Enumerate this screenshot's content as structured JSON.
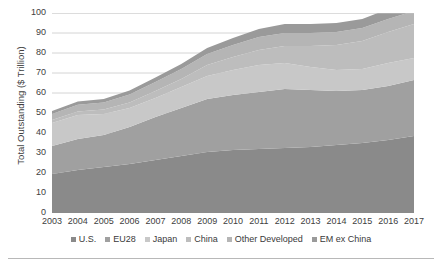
{
  "chart_data": {
    "type": "area",
    "stacked": true,
    "title": "",
    "xlabel": "",
    "ylabel": "Total Outstanding ($ Trillion)",
    "ylim": [
      0,
      100
    ],
    "yticks": [
      0,
      10,
      20,
      30,
      40,
      50,
      60,
      70,
      80,
      90,
      100
    ],
    "grid": "horizontal",
    "legend_position": "bottom",
    "categories": [
      "2003",
      "2004",
      "2005",
      "2006",
      "2007",
      "2008",
      "2009",
      "2010",
      "2011",
      "2012",
      "2013",
      "2014",
      "2015",
      "2016",
      "2017"
    ],
    "x": [
      2003,
      2004,
      2005,
      2006,
      2007,
      2008,
      2009,
      2010,
      2011,
      2012,
      2013,
      2014,
      2015,
      2016,
      2017
    ],
    "series": [
      {
        "name": "U.S.",
        "color": "#8a8a8a",
        "values": [
          19.5,
          21.5,
          23.0,
          24.5,
          26.5,
          28.5,
          30.5,
          31.5,
          32.0,
          32.5,
          33.0,
          34.0,
          35.0,
          36.5,
          38.5
        ]
      },
      {
        "name": "EU28",
        "color": "#a0a0a0",
        "values": [
          14.0,
          15.5,
          16.0,
          18.5,
          21.5,
          24.0,
          26.5,
          27.5,
          28.5,
          29.5,
          28.5,
          27.0,
          26.5,
          27.0,
          28.0
        ]
      },
      {
        "name": "Japan",
        "color": "#c8c8c8",
        "values": [
          11.5,
          12.0,
          10.5,
          9.5,
          9.5,
          10.5,
          11.5,
          12.5,
          13.5,
          13.0,
          11.5,
          10.5,
          10.5,
          11.5,
          11.0
        ]
      },
      {
        "name": "China",
        "color": "#bdbdbd",
        "values": [
          1.5,
          1.8,
          2.2,
          2.8,
          3.5,
          4.0,
          5.5,
          6.5,
          7.5,
          8.5,
          10.5,
          12.5,
          14.0,
          15.5,
          17.0
        ]
      },
      {
        "name": "Other Developed",
        "color": "#b5b5b5",
        "values": [
          3.0,
          3.3,
          3.5,
          4.0,
          4.5,
          5.0,
          5.5,
          6.0,
          6.5,
          6.5,
          6.5,
          6.5,
          6.5,
          6.5,
          6.5
        ]
      },
      {
        "name": "EM ex China",
        "color": "#9a9a9a",
        "values": [
          1.5,
          1.6,
          1.8,
          2.0,
          2.3,
          2.5,
          3.0,
          3.5,
          4.0,
          4.5,
          4.5,
          4.5,
          4.5,
          5.0,
          5.5
        ]
      }
    ],
    "totals": [
      51.0,
      55.7,
      57.0,
      61.3,
      67.8,
      74.5,
      82.5,
      87.5,
      92.0,
      94.5,
      94.5,
      95.0,
      97.0,
      102.0,
      106.5
    ]
  },
  "axis": {
    "y_title": "Total Outstanding ($ Trillion)",
    "y_ticks": [
      "100",
      "90",
      "80",
      "70",
      "60",
      "50",
      "40",
      "30",
      "20",
      "10",
      "0"
    ],
    "x_ticks": [
      "2003",
      "2004",
      "2005",
      "2006",
      "2007",
      "2008",
      "2009",
      "2010",
      "2011",
      "2012",
      "2013",
      "2014",
      "2015",
      "2016",
      "2017"
    ]
  },
  "legend": {
    "items": [
      {
        "label": "U.S.",
        "color": "#8a8a8a"
      },
      {
        "label": "EU28",
        "color": "#a0a0a0"
      },
      {
        "label": "Japan",
        "color": "#c8c8c8"
      },
      {
        "label": "China",
        "color": "#bdbdbd"
      },
      {
        "label": "Other Developed",
        "color": "#b5b5b5"
      },
      {
        "label": "EM ex China",
        "color": "#9a9a9a"
      }
    ]
  },
  "colors": {
    "gridline": "#c9c9c9",
    "axis_text": "#404040",
    "rule": "#b8b8b8",
    "background": "#ffffff"
  }
}
